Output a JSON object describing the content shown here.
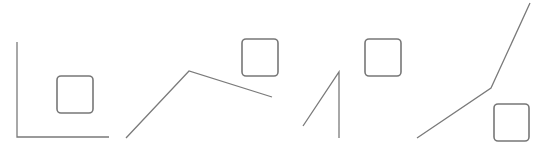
{
  "canvas": {
    "width": 549,
    "height": 147,
    "background": "#ffffff"
  },
  "style": {
    "stroke": "#7a7a7a",
    "box_stroke": "#777777",
    "stroke_width": 1.3,
    "box_radius": 4
  },
  "panels": [
    {
      "id": "panel-1",
      "line": [
        [
          17,
          42
        ],
        [
          17,
          137
        ],
        [
          109,
          137
        ]
      ],
      "box": {
        "x": 57,
        "y": 76,
        "w": 36,
        "h": 37
      }
    },
    {
      "id": "panel-2",
      "line": [
        [
          126,
          138
        ],
        [
          189,
          71
        ],
        [
          272,
          97
        ]
      ],
      "box": {
        "x": 242,
        "y": 39,
        "w": 36,
        "h": 37
      }
    },
    {
      "id": "panel-3",
      "line": [
        [
          303,
          126
        ],
        [
          339,
          72
        ],
        [
          339,
          138
        ]
      ],
      "box": {
        "x": 365,
        "y": 39,
        "w": 36,
        "h": 37
      }
    },
    {
      "id": "panel-4",
      "line": [
        [
          417,
          138
        ],
        [
          491,
          88
        ],
        [
          530,
          3
        ]
      ],
      "box": {
        "x": 494,
        "y": 104,
        "w": 35,
        "h": 37
      }
    }
  ]
}
